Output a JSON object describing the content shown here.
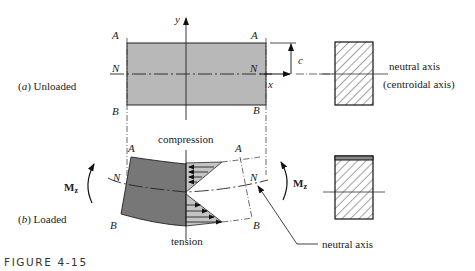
{
  "figure": {
    "caption": "FIGURE 4-15",
    "panel_a": {
      "label_prefix": "(",
      "label_letter": "a",
      "label_suffix": ")  Unloaded",
      "corner_A_left": "A",
      "corner_A_right": "A",
      "corner_N_left": "N",
      "corner_N_right": "N",
      "corner_B_left": "B",
      "corner_B_right": "B",
      "axis_y": "y",
      "axis_x": "x",
      "dimension_c": "c",
      "cross_section_label_1": "neutral axis",
      "cross_section_label_2": "(centroidal axis)"
    },
    "panel_b": {
      "label_prefix": "(",
      "label_letter": "b",
      "label_suffix": ")  Loaded",
      "corner_A_left": "A",
      "corner_A_right": "A",
      "corner_N_left": "N",
      "corner_N_right": "N",
      "corner_B_left": "B",
      "corner_B_right": "B",
      "moment_left": "M",
      "moment_right": "M",
      "moment_subscript": "z",
      "compression_label": "compression",
      "tension_label": "tension",
      "neutral_axis_callout": "neutral axis"
    },
    "colors": {
      "beam_unloaded": "#b8b8b8",
      "beam_loaded": "#777777",
      "stress_fill": "#c4c4c4",
      "line": "#222222"
    }
  }
}
